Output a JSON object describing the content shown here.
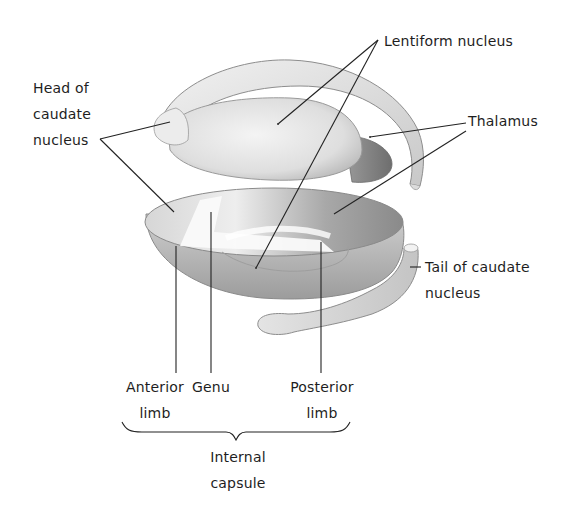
{
  "diagram": {
    "type": "anatomical-illustration",
    "labels": {
      "lentiform": "Lentiform nucleus",
      "head_caudate": [
        "Head of",
        "caudate",
        "nucleus"
      ],
      "thalamus": "Thalamus",
      "tail_caudate": [
        "Tail of caudate",
        "nucleus"
      ],
      "anterior_limb": [
        "Anterior",
        "limb"
      ],
      "genu": "Genu",
      "posterior_limb": [
        "Posterior",
        "limb"
      ],
      "internal_capsule": [
        "Internal",
        "capsule"
      ]
    },
    "colors": {
      "background": "#ffffff",
      "ink": "#1e1e1e",
      "shade_light": "#e6e6e6",
      "shade_mid": "#b9b9b9",
      "shade_dark": "#7a7a7a"
    }
  }
}
